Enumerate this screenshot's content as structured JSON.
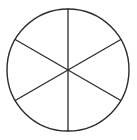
{
  "diagram": {
    "kind": "circle-divided-into-equal-sectors",
    "sectors": 6,
    "sector_fraction": "1/6",
    "sector_angle_degrees": 60,
    "diameter_angles_degrees": [
      90,
      30,
      150
    ],
    "stroke_color": "#2b2b2b",
    "fill_color": "#ffffff",
    "labels": []
  }
}
